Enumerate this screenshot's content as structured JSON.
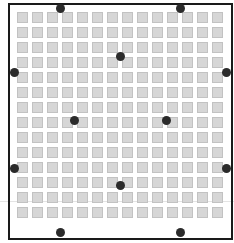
{
  "diagram": {
    "grid": {
      "columns": 14,
      "rows": 14,
      "cell_fill": "#d6d6d6",
      "cell_border": "#c2c2c2"
    },
    "border_color": "#1a1a1a",
    "dot_color": "#2b2b2b",
    "dots": [
      {
        "x": 60,
        "y": 8
      },
      {
        "x": 180,
        "y": 8
      },
      {
        "x": 120,
        "y": 56
      },
      {
        "x": 14,
        "y": 72
      },
      {
        "x": 226,
        "y": 72
      },
      {
        "x": 74,
        "y": 120
      },
      {
        "x": 166,
        "y": 120
      },
      {
        "x": 14,
        "y": 168
      },
      {
        "x": 226,
        "y": 168
      },
      {
        "x": 120,
        "y": 185
      },
      {
        "x": 60,
        "y": 232
      },
      {
        "x": 180,
        "y": 232
      }
    ]
  }
}
